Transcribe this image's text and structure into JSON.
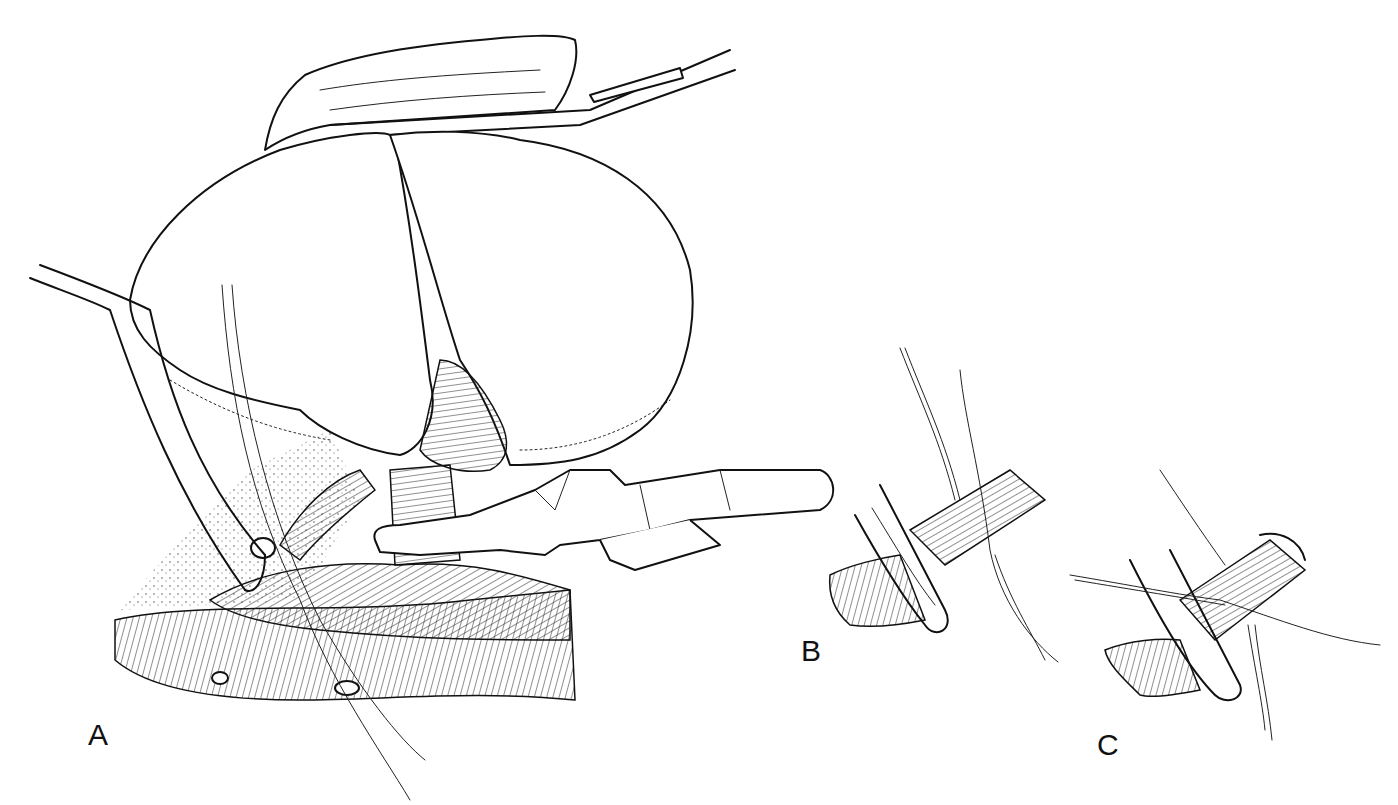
{
  "figure": {
    "background": "#ffffff",
    "ink_color": "#111111",
    "panels": [
      {
        "id": "A",
        "label": "A",
        "description": "Main view: retracted organ lifted by forceps, vessel encircled by clamp with ligature threads, forceps gripping pedicle above large vessel"
      },
      {
        "id": "B",
        "label": "B",
        "description": "Detail: curved clamp passed around vessel with ligature threads"
      },
      {
        "id": "C",
        "label": "C",
        "description": "Detail: vessel ligated with threads tied around it, clamp beneath"
      }
    ]
  }
}
